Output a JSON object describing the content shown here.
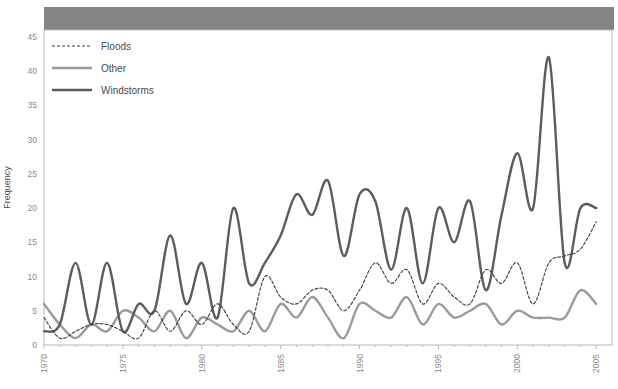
{
  "figure": {
    "background_color": "#ffffff",
    "plot_background_color": "#ffffff",
    "header_band_color": "#848484",
    "frame_color": "#b8b8b8"
  },
  "chart_data": {
    "type": "line",
    "title": "",
    "subtitle": "",
    "xlabel": "",
    "ylabel": "Frequency",
    "xlim": [
      1970,
      2006
    ],
    "ylim": [
      0,
      46
    ],
    "grid": false,
    "legend_position": "top-left",
    "x_major_ticks": [
      "1970",
      "1975",
      "1980",
      "1985",
      "1990",
      "1995",
      "2000",
      "2005"
    ],
    "x_major_tick_values": [
      1970,
      1975,
      1980,
      1985,
      1990,
      1995,
      2000,
      2005
    ],
    "y_ticks": [
      "0",
      "5",
      "10",
      "15",
      "20",
      "25",
      "30",
      "35",
      "40",
      "45"
    ],
    "y_tick_values": [
      0,
      5,
      10,
      15,
      20,
      25,
      30,
      35,
      40,
      45
    ],
    "x": [
      1970,
      1971,
      1972,
      1973,
      1974,
      1975,
      1976,
      1977,
      1978,
      1979,
      1980,
      1981,
      1982,
      1983,
      1984,
      1985,
      1986,
      1987,
      1988,
      1989,
      1990,
      1991,
      1992,
      1993,
      1994,
      1995,
      1996,
      1997,
      1998,
      1999,
      2000,
      2001,
      2002,
      2003,
      2004,
      2005
    ],
    "series": [
      {
        "name": "Floods",
        "color": "#3c3c3c",
        "style": "dashed",
        "width": 1.1,
        "values": [
          4,
          1,
          2,
          3,
          3,
          2,
          1,
          5,
          2,
          5,
          3,
          6,
          3,
          2,
          10,
          7,
          6,
          8,
          8,
          5,
          8,
          12,
          9,
          11,
          6,
          9,
          7,
          6,
          11,
          9,
          12,
          6,
          12,
          13,
          14,
          18
        ]
      },
      {
        "name": "Other",
        "color": "#9a9a9a",
        "style": "solid",
        "width": 2.4,
        "values": [
          6,
          3,
          1,
          3,
          2,
          5,
          4,
          2,
          5,
          1,
          4,
          3,
          2,
          5,
          2,
          6,
          4,
          7,
          4,
          1,
          6,
          5,
          4,
          7,
          3,
          6,
          4,
          5,
          6,
          3,
          5,
          4,
          4,
          4,
          8,
          6
        ]
      },
      {
        "name": "Windstorms",
        "color": "#5c5c5c",
        "style": "solid",
        "width": 2.4,
        "values": [
          2,
          3,
          12,
          3,
          12,
          2,
          6,
          5,
          16,
          6,
          12,
          4,
          20,
          9,
          12,
          16,
          22,
          19,
          24,
          13,
          22,
          21,
          11,
          20,
          9,
          20,
          15,
          21,
          8,
          19,
          28,
          20,
          42,
          12,
          20,
          20
        ]
      }
    ]
  },
  "legend": {
    "entries": [
      {
        "label": "Floods"
      },
      {
        "label": "Other"
      },
      {
        "label": "Windstorms"
      }
    ]
  }
}
